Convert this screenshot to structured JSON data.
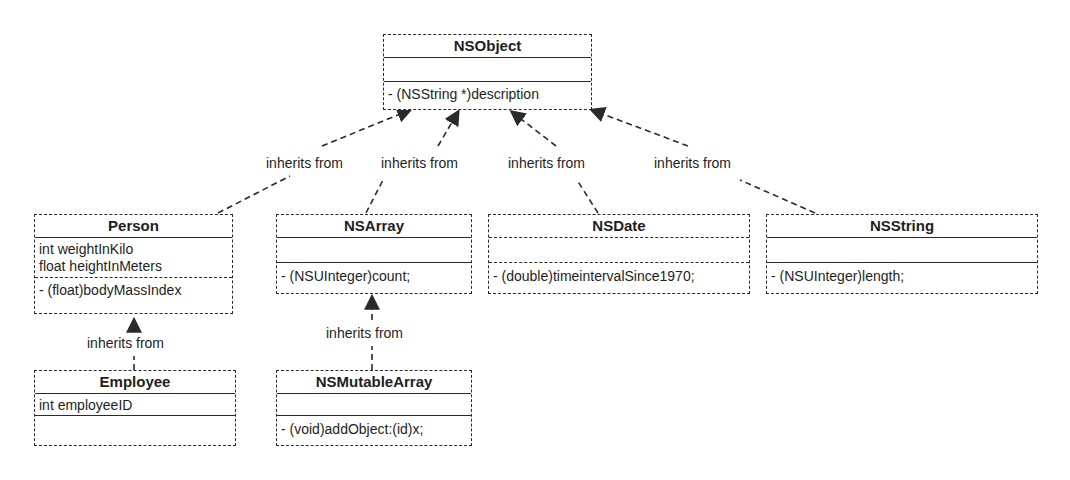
{
  "diagram": {
    "type": "UML class inheritance diagram",
    "edge_label": "inherits from",
    "classes": [
      {
        "name": "NSObject",
        "attributes": [],
        "methods": [
          "- (NSString *)description"
        ]
      },
      {
        "name": "Person",
        "attributes": [
          "int weightInKilo",
          "float heightInMeters"
        ],
        "methods": [
          "- (float)bodyMassIndex"
        ]
      },
      {
        "name": "NSArray",
        "attributes": [],
        "methods": [
          "- (NSUInteger)count;"
        ]
      },
      {
        "name": "NSDate",
        "attributes": [],
        "methods": [
          "- (double)timeintervalSince1970;"
        ]
      },
      {
        "name": "NSString",
        "attributes": [],
        "methods": [
          "- (NSUInteger)length;"
        ]
      },
      {
        "name": "Employee",
        "attributes": [
          "int employeeID"
        ],
        "methods": []
      },
      {
        "name": "NSMutableArray",
        "attributes": [],
        "methods": [
          "- (void)addObject:(id)x;"
        ]
      }
    ],
    "edges": [
      {
        "from": "Person",
        "to": "NSObject",
        "label": "inherits from"
      },
      {
        "from": "NSArray",
        "to": "NSObject",
        "label": "inherits from"
      },
      {
        "from": "NSDate",
        "to": "NSObject",
        "label": "inherits from"
      },
      {
        "from": "NSString",
        "to": "NSObject",
        "label": "inherits from"
      },
      {
        "from": "Employee",
        "to": "Person",
        "label": "inherits from"
      },
      {
        "from": "NSMutableArray",
        "to": "NSArray",
        "label": "inherits from"
      }
    ]
  }
}
